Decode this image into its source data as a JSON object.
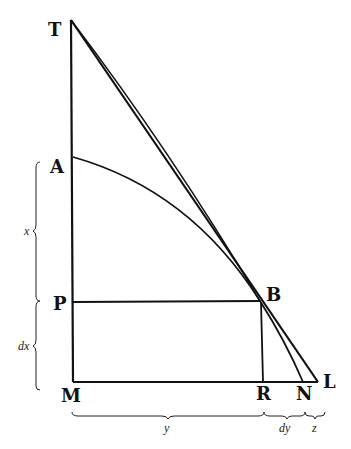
{
  "diagram": {
    "points": [
      {
        "id": "T",
        "label": "T",
        "x": 71,
        "y": 20
      },
      {
        "id": "A",
        "label": "A",
        "x": 73,
        "y": 157
      },
      {
        "id": "P",
        "label": "P",
        "x": 73,
        "y": 304
      },
      {
        "id": "M",
        "label": "M",
        "x": 73,
        "y": 382
      },
      {
        "id": "B",
        "label": "B",
        "x": 260,
        "y": 301
      },
      {
        "id": "R",
        "label": "R",
        "x": 263,
        "y": 382
      },
      {
        "id": "N",
        "label": "N",
        "x": 303,
        "y": 382
      },
      {
        "id": "L",
        "label": "L",
        "x": 318,
        "y": 382
      }
    ],
    "braces": {
      "x": "x",
      "dx": "dx",
      "y": "y",
      "dy": "dy",
      "z": "z"
    },
    "stroke_color": "#111111"
  }
}
